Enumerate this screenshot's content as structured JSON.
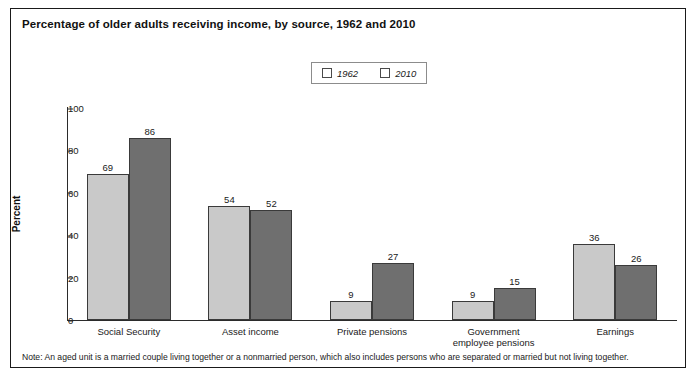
{
  "title": "Percentage of older adults receiving income, by source, 1962 and 2010",
  "note": "Note: An aged unit is a married couple living together or a nonmarried person, which also includes persons who are separated or married but not living together.",
  "legend": {
    "items": [
      {
        "label": "1962",
        "color": "#c9c9c9"
      },
      {
        "label": "2010",
        "color": "#6f6f6f"
      }
    ]
  },
  "chart_data": {
    "type": "bar",
    "title": "Percentage of older adults receiving income, by source, 1962 and 2010",
    "xlabel": "",
    "ylabel": "Percent",
    "ylim": [
      0,
      100
    ],
    "yticks": [
      0,
      20,
      40,
      60,
      80,
      100
    ],
    "grid": false,
    "legend_position": "top-center",
    "categories": [
      "Social Security",
      "Asset income",
      "Private pensions",
      "Government\nemployee pensions",
      "Earnings"
    ],
    "series": [
      {
        "name": "1962",
        "color": "#c9c9c9",
        "values": [
          69,
          54,
          9,
          9,
          36
        ]
      },
      {
        "name": "2010",
        "color": "#6f6f6f",
        "values": [
          86,
          52,
          27,
          15,
          26
        ]
      }
    ]
  }
}
